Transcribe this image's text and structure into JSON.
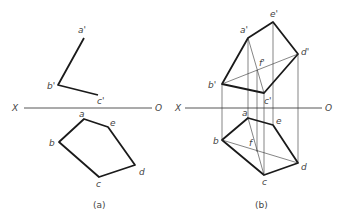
{
  "figure_a": {
    "caption": "(a)",
    "axis": {
      "left_label": "X",
      "right_label": "O"
    },
    "front_view_labels": {
      "a": "a'",
      "b": "b'",
      "c": "c'"
    },
    "top_view_labels": {
      "a": "a",
      "b": "b",
      "c": "c",
      "d": "d",
      "e": "e"
    }
  },
  "figure_b": {
    "caption": "(b)",
    "axis": {
      "left_label": "X",
      "right_label": "O"
    },
    "front_view_labels": {
      "a": "a'",
      "b": "b'",
      "c": "c'",
      "d": "d'",
      "e": "e'",
      "f": "f'"
    },
    "top_view_labels": {
      "a": "a",
      "b": "b",
      "c": "c",
      "d": "d",
      "e": "e",
      "f": "f"
    }
  }
}
